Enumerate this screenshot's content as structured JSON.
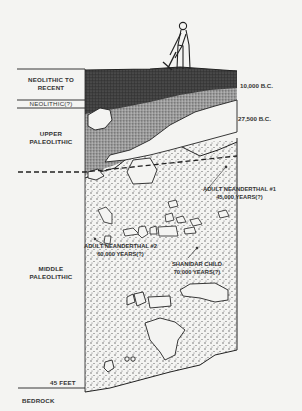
{
  "diagram": {
    "layers_left": [
      {
        "id": "neolithic-recent",
        "label_line1": "NEOLITHIC TO",
        "label_line2": "RECENT"
      },
      {
        "id": "neolithic-q",
        "label": "NEOLITHIC(?)"
      },
      {
        "id": "upper-paleolithic",
        "label_line1": "UPPER",
        "label_line2": "PALEOLITHIC"
      },
      {
        "id": "middle-paleolithic",
        "label_line1": "MIDDLE",
        "label_line2": "PALEOLITHIC"
      },
      {
        "id": "bedrock",
        "label": "BEDROCK"
      }
    ],
    "dates_right": [
      {
        "id": "date-10000",
        "label": "10,000 B.C."
      },
      {
        "id": "date-27500",
        "label": "27,500 B.C."
      }
    ],
    "depth_marker": "45 FEET",
    "finds": [
      {
        "id": "neanderthal-1",
        "line1": "ADULT NEANDERTHAL #1",
        "line2": "45,000  YEARS(?)"
      },
      {
        "id": "neanderthal-2",
        "line1": "ADULT NEANDERTHAL #2",
        "line2": "60,000  YEARS(?)"
      },
      {
        "id": "shanidar-child",
        "line1": "SHANIDAR CHILD",
        "line2": "70,000  YEARS(?)"
      }
    ],
    "figure": "excavator-with-pickaxe",
    "colors": {
      "background": "#f4f4f2",
      "dark_layer": "#3a3a3a",
      "mid_layer": "#8a8a8a",
      "stipple": "#555555",
      "rock_fill": "#f4f4f2",
      "line": "#222222"
    }
  }
}
